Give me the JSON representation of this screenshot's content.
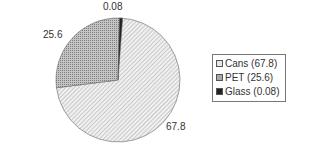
{
  "chart_data": {
    "type": "pie",
    "title": "",
    "categories": [
      "Cans",
      "PET",
      "Glass"
    ],
    "values": [
      67.8,
      25.6,
      0.08
    ],
    "data_labels": [
      "67.8",
      "25.6",
      "0.08"
    ],
    "legend": {
      "position": "right",
      "entries": [
        "Cans (67.8)",
        "PET (25.6)",
        "Glass (0.08)"
      ]
    },
    "colors": {
      "Cans": "#d8d8d8",
      "PET": "#a8a8a8",
      "Glass": "#222222"
    }
  }
}
